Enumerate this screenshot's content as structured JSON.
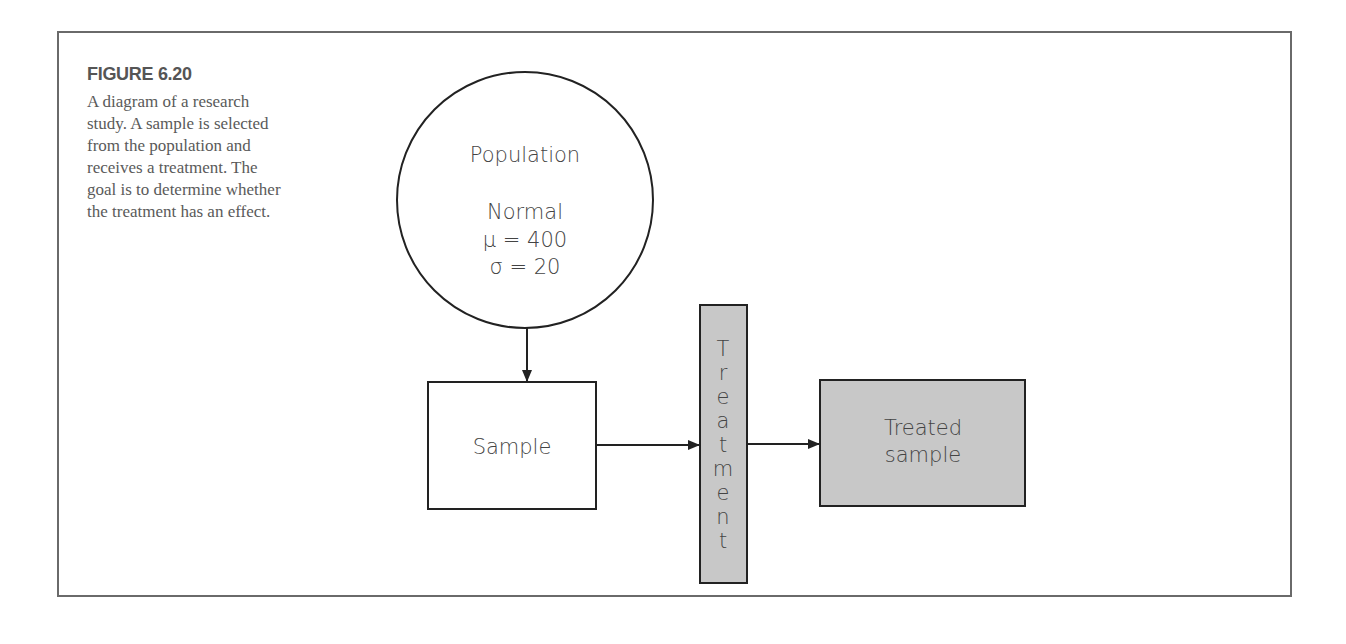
{
  "figure": {
    "number_label": "FIGURE 6.20",
    "caption": "A diagram of a research\nstudy. A sample is selected\nfrom the population and\nreceives a treatment. The\ngoal is to determine whether\nthe treatment has an effect."
  },
  "diagram": {
    "population": {
      "title": "Population",
      "distribution": "Normal",
      "mean_line": "μ = 400",
      "sd_line": "σ = 20"
    },
    "sample": {
      "label": "Sample"
    },
    "treatment": {
      "label": "Treatment",
      "letters": [
        "T",
        "r",
        "e",
        "a",
        "t",
        "m",
        "e",
        "n",
        "t"
      ]
    },
    "treated_sample": {
      "line1": "Treated",
      "line2": "sample"
    },
    "colors": {
      "stroke": "#222222",
      "shaded_fill": "#c8c8c8",
      "frame": "#6a6a6a",
      "text": "#444444"
    }
  }
}
